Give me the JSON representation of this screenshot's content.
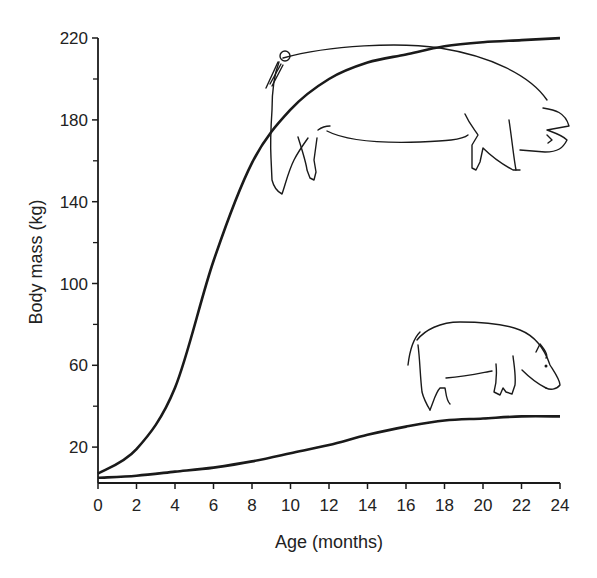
{
  "chart_data": {
    "type": "line",
    "title": "",
    "xlabel": "Age (months)",
    "ylabel": "Body mass (kg)",
    "xlim": [
      0,
      24
    ],
    "ylim": [
      0,
      220
    ],
    "xticks": [
      0,
      2,
      4,
      6,
      8,
      10,
      12,
      14,
      16,
      18,
      20,
      22,
      24
    ],
    "yticks_labeled": [
      20,
      60,
      100,
      140,
      180,
      220
    ],
    "yticks_minor": [
      40,
      80,
      120,
      160,
      200
    ],
    "grid": false,
    "legend": "none (series identified by pig illustrations)",
    "x": [
      0,
      2,
      4,
      6,
      8,
      10,
      12,
      14,
      16,
      18,
      20,
      22,
      24
    ],
    "series": [
      {
        "name": "Large (domestic) pig",
        "illustration": "large-pig-illustration",
        "values": [
          7,
          19,
          49,
          111,
          159,
          185,
          200,
          208,
          212,
          216,
          218,
          219,
          220
        ]
      },
      {
        "name": "Small (miniature) pig",
        "illustration": "small-pig-illustration",
        "values": [
          5,
          6,
          8,
          10,
          13,
          17,
          21,
          26,
          30,
          33,
          34,
          35,
          35
        ]
      }
    ],
    "line_color": "#1a1a1a"
  }
}
